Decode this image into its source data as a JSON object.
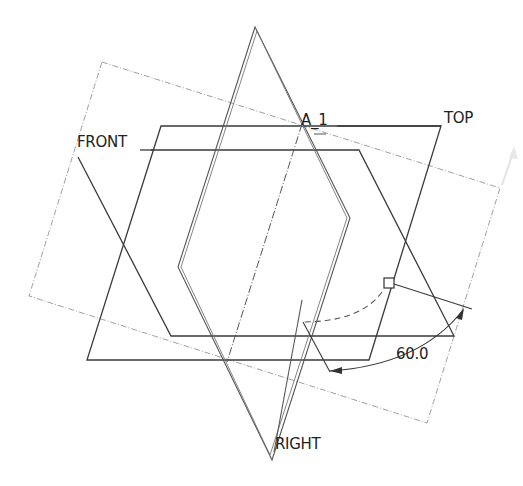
{
  "diagram": {
    "type": "cad-datum-planes",
    "colors": {
      "edge": "#3a3a3a",
      "dashed_boundary": "#9a9a9a",
      "axis": "#555555",
      "text": "#222222",
      "background": "#ffffff"
    },
    "planes": [
      {
        "name": "FRONT",
        "label": "FRONT"
      },
      {
        "name": "TOP",
        "label": "TOP"
      },
      {
        "name": "RIGHT",
        "label": "RIGHT"
      }
    ],
    "axis": {
      "label": "A_1"
    },
    "dimension": {
      "value": "60.0",
      "type": "angle"
    }
  },
  "labels": {
    "front": "FRONT",
    "top": "TOP",
    "right": "RIGHT",
    "axis": "A_1",
    "dimension": "60.0"
  }
}
